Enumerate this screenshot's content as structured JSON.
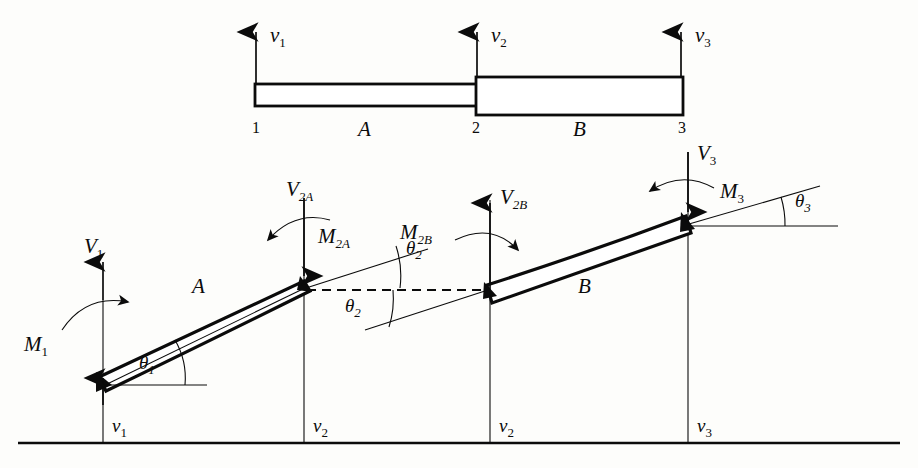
{
  "figure": {
    "ink_color": "#0b0b0b",
    "background_color": "#fdfdfb"
  },
  "top_diagram": {
    "caption": "Undeformed beam with nodal displacement arrows",
    "elements": [
      {
        "id": "A",
        "label": "A"
      },
      {
        "id": "B",
        "label": "B"
      }
    ],
    "nodes": [
      {
        "id": "1",
        "label": "1"
      },
      {
        "id": "2",
        "label": "2"
      },
      {
        "id": "3",
        "label": "3"
      }
    ],
    "displacements": [
      {
        "id": "v1",
        "symbol": "v",
        "subscript": "1"
      },
      {
        "id": "v2",
        "symbol": "v",
        "subscript": "2"
      },
      {
        "id": "v3",
        "symbol": "v",
        "subscript": "3"
      }
    ]
  },
  "bottom_diagram": {
    "caption": "Deformed beam elements with end shears, end moments and rotations",
    "elements": [
      {
        "id": "A",
        "label": "A"
      },
      {
        "id": "B",
        "label": "B"
      }
    ],
    "shear_forces": [
      {
        "id": "V1",
        "symbol": "V",
        "subscript": "1",
        "direction": "up"
      },
      {
        "id": "V2A",
        "symbol": "V",
        "subscript": "2A",
        "direction": "down"
      },
      {
        "id": "V2B",
        "symbol": "V",
        "subscript": "2B",
        "direction": "up"
      },
      {
        "id": "V3",
        "symbol": "V",
        "subscript": "3",
        "direction": "down"
      }
    ],
    "moments": [
      {
        "id": "M1",
        "symbol": "M",
        "subscript": "1",
        "sense": "clockwise"
      },
      {
        "id": "M2A",
        "symbol": "M",
        "subscript": "2A",
        "sense": "counterclockwise"
      },
      {
        "id": "M2B",
        "symbol": "M",
        "subscript": "2B",
        "sense": "clockwise"
      },
      {
        "id": "M3",
        "symbol": "M",
        "subscript": "3",
        "sense": "counterclockwise"
      }
    ],
    "rotations": [
      {
        "id": "theta1",
        "symbol": "θ",
        "subscript": "1"
      },
      {
        "id": "theta2A",
        "symbol": "θ",
        "subscript": "2"
      },
      {
        "id": "theta2B",
        "symbol": "θ",
        "subscript": "2"
      },
      {
        "id": "theta3",
        "symbol": "θ",
        "subscript": "3"
      }
    ],
    "displacements": [
      {
        "id": "v1",
        "symbol": "v",
        "subscript": "1"
      },
      {
        "id": "v2A",
        "symbol": "v",
        "subscript": "2"
      },
      {
        "id": "v2B",
        "symbol": "v",
        "subscript": "2"
      },
      {
        "id": "v3",
        "symbol": "v",
        "subscript": "3"
      }
    ]
  }
}
